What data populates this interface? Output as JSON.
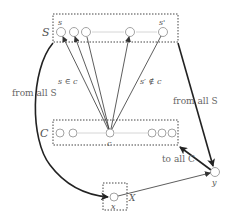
{
  "diagram": {
    "set_S": {
      "label": "S",
      "first_element_label": "s",
      "last_element_label": "s'",
      "element_count_shown": 5
    },
    "set_C": {
      "label": "C",
      "center_element_label": "c",
      "element_count_shown": 6
    },
    "node_x": {
      "label": "x",
      "box_label": "X"
    },
    "node_y": {
      "label": "y"
    },
    "edge_labels": {
      "s_in_c": "s ∈ c",
      "s_prime_not_in_c": "s′ ∉ c",
      "from_all_S_left": "from all S",
      "from_all_S_right": "from all S",
      "to_all_C": "to all C"
    },
    "colors": {
      "stroke": "#333333",
      "thick_stroke": "#222222",
      "node": "#999999",
      "dotted_box": "#444444",
      "text": "#555555"
    }
  }
}
